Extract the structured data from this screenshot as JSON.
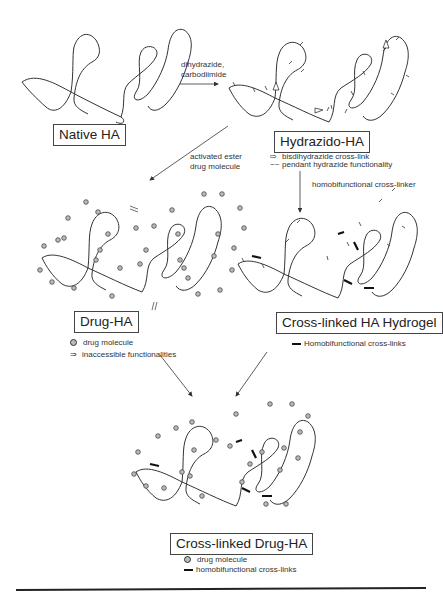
{
  "diagram": {
    "type": "reaction-scheme",
    "stages": {
      "native": {
        "label": "Native HA"
      },
      "hydrazido": {
        "label": "Hydrazido-HA",
        "legend": [
          {
            "symbol": "open-arrow",
            "text": "bisdihydrazide cross-link"
          },
          {
            "symbol": "squiggle",
            "text": "pendant hydrazide functionality"
          }
        ]
      },
      "drug": {
        "label": "Drug-HA",
        "legend": [
          {
            "symbol": "sphere",
            "text": "drug molecule"
          },
          {
            "symbol": "double-arrow",
            "text": "inaccessible functionalities"
          }
        ]
      },
      "hydrogel": {
        "label": "Cross-linked HA Hydrogel",
        "legend": [
          {
            "symbol": "bold-bar",
            "text": "Homobifunctional cross-links"
          }
        ]
      },
      "crosslinked_drug": {
        "label": "Cross-linked Drug-HA",
        "legend": [
          {
            "symbol": "sphere",
            "text": "drug molecule"
          },
          {
            "symbol": "bold-bar",
            "text": "homobifunctional cross-links"
          }
        ]
      }
    },
    "reactions": {
      "step1": {
        "line1": "dihydrazide,",
        "line2": "carbodiimide",
        "from": "Native HA",
        "to": "Hydrazido-HA"
      },
      "step2": {
        "line1": "activated ester",
        "line2": "drug molecule",
        "from": "Hydrazido-HA",
        "to": "Drug-HA"
      },
      "step3": {
        "line1": "homobifunctional cross-linker",
        "from": "Hydrazido-HA",
        "to": "Cross-linked HA Hydrogel"
      },
      "step4": {
        "from": [
          "Drug-HA",
          "Cross-linked HA Hydrogel"
        ],
        "to": "Cross-linked Drug-HA"
      }
    },
    "colors": {
      "line": "#333333",
      "sphere_fill": "#bbbbbb",
      "crosslink": "#111111"
    }
  }
}
